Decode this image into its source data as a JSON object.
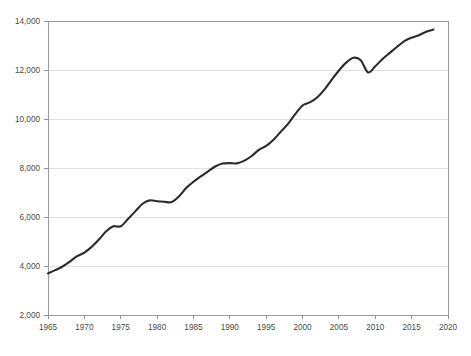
{
  "chart_data": {
    "type": "line",
    "title": "",
    "subtitle": "",
    "xlabel": "",
    "ylabel": "",
    "xlim": [
      1965,
      2020
    ],
    "ylim": [
      2000,
      14000
    ],
    "grid": true,
    "legend": "none",
    "x_ticks": [
      "1965",
      "1970",
      "1975",
      "1980",
      "1985",
      "1990",
      "1995",
      "2000",
      "2005",
      "2010",
      "2015",
      "2020"
    ],
    "x_tick_values": [
      1965,
      1970,
      1975,
      1980,
      1985,
      1990,
      1995,
      2000,
      2005,
      2010,
      2015,
      2020
    ],
    "y_ticks": [
      "2,000",
      "4,000",
      "6,000",
      "8,000",
      "10,000",
      "12,000",
      "14,000"
    ],
    "y_tick_values": [
      2000,
      4000,
      6000,
      8000,
      10000,
      12000,
      14000
    ],
    "series": [
      {
        "name": "",
        "color": "#2b2b2b",
        "x": [
          1965,
          1966,
          1967,
          1968,
          1969,
          1970,
          1971,
          1972,
          1973,
          1974,
          1975,
          1976,
          1977,
          1978,
          1979,
          1980,
          1981,
          1982,
          1983,
          1984,
          1985,
          1986,
          1987,
          1988,
          1989,
          1990,
          1991,
          1992,
          1993,
          1994,
          1995,
          1996,
          1997,
          1998,
          1999,
          2000,
          2001,
          2002,
          2003,
          2004,
          2005,
          2006,
          2007,
          2008,
          2009,
          2010,
          2011,
          2012,
          2013,
          2014,
          2015,
          2016,
          2017,
          2018
        ],
        "values": [
          3700,
          3830,
          3980,
          4180,
          4400,
          4550,
          4780,
          5080,
          5420,
          5620,
          5620,
          5920,
          6230,
          6540,
          6680,
          6640,
          6620,
          6610,
          6840,
          7180,
          7440,
          7660,
          7860,
          8060,
          8180,
          8200,
          8190,
          8300,
          8490,
          8740,
          8900,
          9150,
          9480,
          9800,
          10200,
          10550,
          10680,
          10880,
          11200,
          11600,
          11980,
          12300,
          12500,
          12400,
          11900,
          12150,
          12450,
          12700,
          12950,
          13180,
          13320,
          13420,
          13560,
          13650
        ]
      }
    ],
    "annotations": []
  },
  "chart_meta": {
    "plot_left_px": 48,
    "plot_right_px": 448,
    "plot_top_px": 21,
    "plot_bottom_px": 315
  }
}
